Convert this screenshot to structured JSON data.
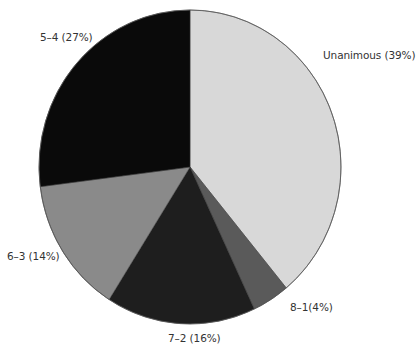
{
  "chart_data": {
    "type": "pie",
    "title": "",
    "start_angle": "12 o'clock",
    "direction": "clockwise",
    "categories": [
      "Unanimous",
      "8–1",
      "7–2",
      "6–3",
      "5–4"
    ],
    "values": [
      39,
      4,
      16,
      14,
      27
    ],
    "unit": "%",
    "colors": [
      "#d8d8d8",
      "#5a5a5a",
      "#1e1e1e",
      "#8a8a8a",
      "#0a0a0a"
    ],
    "labels": [
      "Unanimous (39%)",
      "8–1(4%)",
      "7–2 (16%)",
      "6–3 (14%)",
      "5–4 (27%)"
    ],
    "legend": "none (direct slice labels)"
  },
  "labels": {
    "unanimous": "Unanimous (39%)",
    "eight_one": "8–1(4%)",
    "seven_two": "7–2 (16%)",
    "six_three": "6–3 (14%)",
    "five_four": "5–4 (27%)"
  }
}
